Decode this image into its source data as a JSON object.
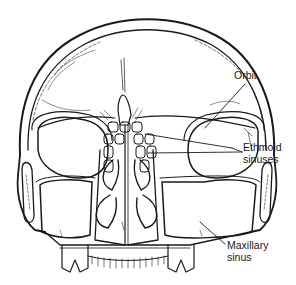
{
  "diagram": {
    "labels": [
      {
        "id": "orbit",
        "lines": [
          "Orbit"
        ]
      },
      {
        "id": "ethmoid",
        "lines": [
          "Ethmoid",
          "sinuses"
        ]
      },
      {
        "id": "maxillary",
        "lines": [
          "Maxillary",
          "sinus"
        ]
      }
    ],
    "colors": {
      "line": "#1a1a1a",
      "background": "#ffffff"
    }
  }
}
